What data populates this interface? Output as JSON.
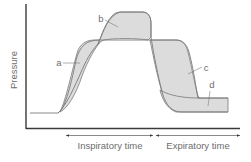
{
  "axes": {
    "ylabel": "Pressure",
    "xlabel_inspiratory": "Inspiratory time",
    "xlabel_expiratory": "Expiratory time"
  },
  "labels": {
    "a": "a",
    "b": "b",
    "c": "c",
    "d": "d"
  },
  "colors": {
    "fill": "#dcdcdc",
    "outline": "#7a7a7a",
    "axis": "#3a3a3a",
    "text": "#6d6d6d"
  }
}
